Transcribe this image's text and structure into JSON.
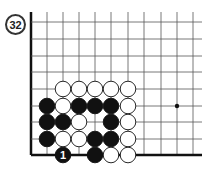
{
  "problem": {
    "number": "32",
    "board": {
      "grid_columns_x": [
        31,
        47,
        63,
        79,
        95,
        111,
        128,
        144,
        161,
        177,
        193
      ],
      "grid_rows_y": [
        22,
        39,
        56,
        72,
        89,
        106,
        122,
        139,
        155
      ],
      "top_y": 12,
      "right_x": 202,
      "edges": [
        "left",
        "bottom"
      ],
      "star_points": [
        [
          9,
          5
        ]
      ],
      "line_color": "#555555",
      "edge_color": "#111111"
    },
    "stones": [
      {
        "col": 2,
        "row": 4,
        "color": "white"
      },
      {
        "col": 3,
        "row": 4,
        "color": "white"
      },
      {
        "col": 4,
        "row": 4,
        "color": "white"
      },
      {
        "col": 5,
        "row": 4,
        "color": "white"
      },
      {
        "col": 6,
        "row": 4,
        "color": "white"
      },
      {
        "col": 1,
        "row": 5,
        "color": "black"
      },
      {
        "col": 2,
        "row": 5,
        "color": "white"
      },
      {
        "col": 3,
        "row": 5,
        "color": "black"
      },
      {
        "col": 4,
        "row": 5,
        "color": "black"
      },
      {
        "col": 5,
        "row": 5,
        "color": "black"
      },
      {
        "col": 6,
        "row": 5,
        "color": "white"
      },
      {
        "col": 1,
        "row": 6,
        "color": "black"
      },
      {
        "col": 2,
        "row": 6,
        "color": "black"
      },
      {
        "col": 3,
        "row": 6,
        "color": "white"
      },
      {
        "col": 5,
        "row": 6,
        "color": "black"
      },
      {
        "col": 6,
        "row": 6,
        "color": "white"
      },
      {
        "col": 1,
        "row": 7,
        "color": "black"
      },
      {
        "col": 2,
        "row": 7,
        "color": "white"
      },
      {
        "col": 3,
        "row": 7,
        "color": "white"
      },
      {
        "col": 4,
        "row": 7,
        "color": "black"
      },
      {
        "col": 5,
        "row": 7,
        "color": "black"
      },
      {
        "col": 6,
        "row": 7,
        "color": "white"
      },
      {
        "col": 2,
        "row": 8,
        "color": "black",
        "label": "1"
      },
      {
        "col": 4,
        "row": 8,
        "color": "black"
      },
      {
        "col": 5,
        "row": 8,
        "color": "white"
      },
      {
        "col": 6,
        "row": 8,
        "color": "white"
      }
    ]
  }
}
